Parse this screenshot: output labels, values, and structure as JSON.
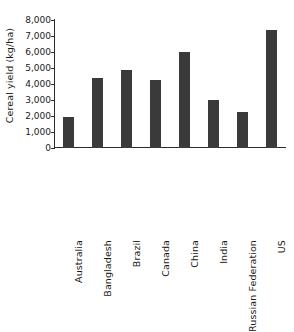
{
  "chart_data": {
    "type": "bar",
    "title": "",
    "subtitle": "",
    "xlabel": "",
    "ylabel": "Cereal yield (kg/ha)",
    "categories": [
      "Australia",
      "Bangladesh",
      "Brazil",
      "Canada",
      "China",
      "India",
      "Russian Federation",
      "US"
    ],
    "values": [
      1950,
      4400,
      4875,
      4250,
      6000,
      3000,
      2250,
      7400
    ],
    "ylim": [
      0,
      8000
    ],
    "ytick_values": [
      0,
      1000,
      2000,
      3000,
      4000,
      5000,
      6000,
      7000,
      8000
    ],
    "ytick_labels": [
      "0",
      "1,000",
      "2,000",
      "3,000",
      "4,000",
      "5,000",
      "6,000",
      "7,000",
      "8,000"
    ],
    "grid": false,
    "legend": false,
    "legend_position": "none",
    "bar_color": "#3a3a3a",
    "axis_color": "#2c2c2c",
    "background_color": "#ffffff",
    "xtick_label_rotation": 90,
    "ylabel_rotation": 90,
    "annotations": []
  }
}
